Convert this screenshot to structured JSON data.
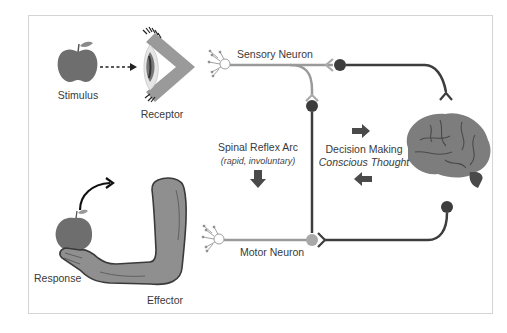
{
  "diagram": {
    "type": "reflex-arc",
    "labels": {
      "stimulus": "Stimulus",
      "receptor": "Receptor",
      "sensory_neuron": "Sensory Neuron",
      "spinal_reflex_arc": "Spinal Reflex Arc",
      "spinal_reflex_sub": "(rapid, involuntary)",
      "decision_making": "Decision Making",
      "conscious_thought": "Conscious Thought",
      "motor_neuron": "Motor Neuron",
      "response": "Response",
      "effector": "Effector"
    },
    "colors": {
      "frame_border": "#d4d4d4",
      "dark_neuron": "#3d3d3d",
      "light_neuron": "#9a9a9a",
      "apple": "#6e6e6e",
      "arm_fill": "#8f8f8f",
      "arm_stroke": "#3a3a3a",
      "brain": "#7d7d7d",
      "text": "#3a3a3a"
    },
    "icons": [
      "apple-icon",
      "eye-icon",
      "brain-icon",
      "arm-icon",
      "dendrite-icon",
      "arrow-right-icon",
      "arrow-left-icon",
      "arrow-down-icon",
      "curved-arrow-icon"
    ]
  }
}
